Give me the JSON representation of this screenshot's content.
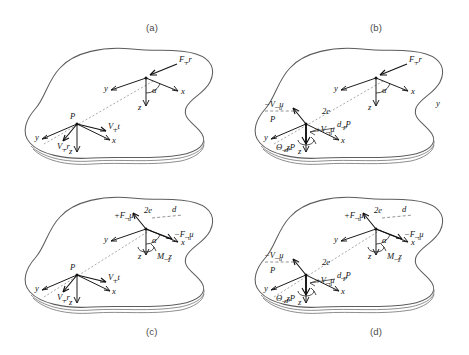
{
  "figure": {
    "background_color": "#ffffff",
    "line_color": "#5d5d5d",
    "ink_color": "#141414"
  },
  "panels": [
    {
      "id": "a",
      "caption": "(a)",
      "caption_position": "top",
      "description": "Resultant force F_r at contact point with tangential and radial velocities at P",
      "upper_cluster": {
        "force_label": "F_r",
        "angle_label": "α",
        "axes": [
          "y",
          "x",
          "z"
        ]
      },
      "lower_cluster": {
        "point_label": "P",
        "velocity_tangential": "V_t",
        "velocity_radial": "V_r",
        "axes": [
          "y",
          "x",
          "z"
        ]
      },
      "extra_labels": []
    },
    {
      "id": "b",
      "caption": "(b)",
      "caption_position": "top",
      "description": "Resultant force F_r with equivalent velocity couple at P",
      "upper_cluster": {
        "force_label": "F_r",
        "angle_label": "α",
        "axes": [
          "y",
          "x",
          "z"
        ]
      },
      "lower_cluster": {
        "point_label": "P",
        "velocity_negative": "−V_u",
        "velocity_positive": "+V_u",
        "eccentricity": "2e",
        "distance": "d_P",
        "rotation": "Θ_zP",
        "axes": [
          "y",
          "x",
          "z"
        ]
      },
      "extra_labels": [
        "y"
      ]
    },
    {
      "id": "c",
      "caption": "(c)",
      "caption_position": "bottom",
      "description": "Force couple +F_u / −F_u with moment M_z and velocities at P",
      "upper_cluster": {
        "force_positive": "+F_u",
        "force_negative": "−F_u",
        "eccentricity": "2e",
        "distance": "d",
        "moment": "M_z",
        "angle_label": "α",
        "axes": [
          "y",
          "x",
          "z"
        ]
      },
      "lower_cluster": {
        "point_label": "P",
        "velocity_tangential": "V_t",
        "velocity_radial": "V_r",
        "axes": [
          "y",
          "x",
          "z"
        ]
      },
      "extra_labels": []
    },
    {
      "id": "d",
      "caption": "(d)",
      "caption_position": "bottom",
      "description": "Force couple with moment M_z plus equivalent velocity couple at P",
      "upper_cluster": {
        "force_positive": "+F_u",
        "force_negative": "−F_u",
        "eccentricity": "2e",
        "distance": "d",
        "moment": "M_z",
        "angle_label": "α",
        "axes": [
          "y",
          "x",
          "z"
        ]
      },
      "lower_cluster": {
        "point_label": "P",
        "velocity_negative": "−V_u",
        "velocity_positive": "+V_u",
        "eccentricity": "2e",
        "distance": "d_P",
        "rotation": "Θ_zP",
        "axes": [
          "y",
          "x",
          "z"
        ]
      },
      "extra_labels": []
    }
  ],
  "axis_labels": {
    "x": "x",
    "y": "y",
    "z": "z"
  }
}
